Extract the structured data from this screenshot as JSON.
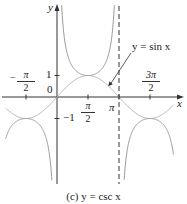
{
  "chart_data": {
    "type": "line",
    "title": "(c) y = csc x",
    "xlabel": "x",
    "ylabel": "y",
    "x_ticks": [
      {
        "value": -1.5708,
        "label": "-π/2"
      },
      {
        "value": 1.5708,
        "label": "π/2"
      },
      {
        "value": 3.1416,
        "label": "π"
      },
      {
        "value": 4.7124,
        "label": "3π/2"
      }
    ],
    "y_ticks": [
      {
        "value": 1,
        "label": "1"
      },
      {
        "value": -1,
        "label": "-1"
      }
    ],
    "origin_label": "0",
    "xlim": [
      -2.8,
      6.0
    ],
    "ylim": [
      -4.0,
      4.5
    ],
    "grid": false,
    "series": [
      {
        "name": "y = csc x",
        "style": "solid",
        "color": "#9a9a9a",
        "description": "Branches with vertical asymptotes at x = 0 and x = π; local min (π/2, 1), local max (-π/2, -1) and (3π/2, -1)"
      },
      {
        "name": "y = sin x",
        "style": "solid",
        "color": "#b8b8b8",
        "description": "Sine curve from -π/2 to 3π/2+, peaks at (π/2, 1), troughs at (-π/2, -1) and (3π/2, -1)"
      }
    ],
    "asymptotes": [
      {
        "x": 3.1416,
        "style": "dashed"
      }
    ],
    "annotations": [
      {
        "text": "y = sin x",
        "arrow_to": [
          2.6,
          0.5
        ]
      }
    ]
  },
  "labels": {
    "y_axis": "y",
    "x_axis": "x",
    "origin": "0",
    "one": "1",
    "minus_one": "−1",
    "neg_pi_half_num": "π",
    "neg_pi_half_sign": "−",
    "pi_half_num": "π",
    "half_den": "2",
    "pi": "π",
    "three_pi_half_num": "3π",
    "sin_label": "y = sin x",
    "caption": "(c) y = csc x"
  }
}
